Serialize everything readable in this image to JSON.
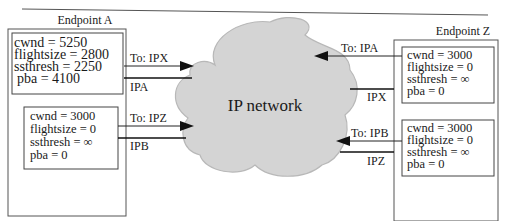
{
  "diagram": {
    "network_label": "IP network",
    "colors": {
      "cloud_fill": "#d4d4d4",
      "cloud_stroke": "#b8b8b8",
      "line": "#222222",
      "box_stroke": "#444444"
    },
    "endpoint_a": {
      "title": "Endpoint A",
      "paths": [
        {
          "state": [
            "cwnd = 5250",
            "flightsize = 2800",
            "ssthresh = 2250",
            "pba = 4100"
          ],
          "out_label": "To: IPX",
          "in_label": "IPA"
        },
        {
          "state": [
            "cwnd = 3000",
            "flightsize = 0",
            "ssthresh = ∞",
            "pba = 0"
          ],
          "out_label": "To: IPZ",
          "in_label": "IPB"
        }
      ]
    },
    "endpoint_z": {
      "title": "Endpoint Z",
      "paths": [
        {
          "state": [
            "cwnd = 3000",
            "flightsize = 0",
            "ssthresh = ∞",
            "pba = 0"
          ],
          "out_label": "To: IPA",
          "in_label": "IPX"
        },
        {
          "state": [
            "cwnd = 3000",
            "flightsize = 0",
            "ssthresh = ∞",
            "pba = 0"
          ],
          "out_label": "To: IPB",
          "in_label": "IPZ"
        }
      ]
    }
  }
}
